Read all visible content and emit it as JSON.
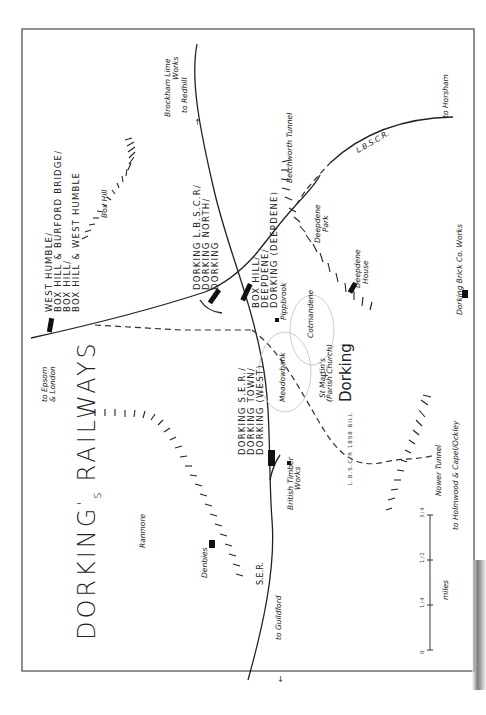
{
  "map": {
    "title": "DORKING's RAILWAYS",
    "title_main": "DORKING",
    "title_apos": "'",
    "title_s": "s",
    "title_rest": "RAILWAYS",
    "town": "Dorking",
    "colors": {
      "ink": "#222222",
      "frame": "#555555",
      "town_outline": "#cccccc",
      "background": "#ffffff"
    }
  },
  "stations": {
    "west_humble": [
      "WEST HUMBLE/",
      "BOX HILL & BURFORD BRIDGE/",
      "BOX HILL/",
      "BOX HILL & WEST HUMBLE"
    ],
    "dorking_lbscr": [
      "DORKING L.B.S.C.R/",
      "DORKING NORTH/",
      "DORKING"
    ],
    "box_hill_deepdene": [
      "BOX HILL/",
      "DEEPDENE/",
      "DORKING (DEEPDENE)"
    ],
    "dorking_ser": [
      "DORKING S.E.R./",
      "DORKING TOWN/",
      "DORKING (WEST)"
    ]
  },
  "places": {
    "box_hill": "Box Hill",
    "ranmore": "Ranmore",
    "denbies": "Denbies",
    "deepdene_park": [
      "Deepdene",
      "Park"
    ],
    "deepdene_house": [
      "Deepdene",
      "House"
    ],
    "pippbrook": "Pippbrook",
    "cotmandene": "Cotmandene",
    "meadowbank": "Meadowbank",
    "st_martins": [
      "St Martin's",
      "(Parish Church)"
    ],
    "british_timber": [
      "British Timber",
      "Works"
    ],
    "brick_works": "Dorking Brick Co. Works"
  },
  "lines": {
    "lbscr": "L.B.S.C.R.",
    "ser": "S.E.R.",
    "lbscr_bill": "L.B.S.C.R 1898 BILL",
    "betchworth_tunnel": "Betchworth Tunnel",
    "nower_tunnel": "Nower Tunnel"
  },
  "destinations": {
    "epsom": [
      "to Epsom",
      "& London"
    ],
    "redhill": "to Redhill",
    "brockham": [
      "Brockham Lime",
      "Works"
    ],
    "horsham": "to Horsham",
    "guildford": "to Guildford",
    "holmwood": "to Holmwood & Capel/Ockley"
  },
  "scale": {
    "unit": "miles",
    "ticks": [
      "0",
      "1/4",
      "1/2",
      "3/4"
    ]
  }
}
